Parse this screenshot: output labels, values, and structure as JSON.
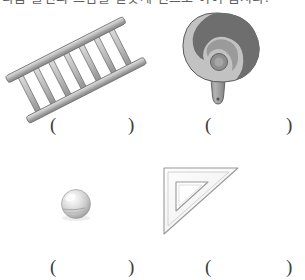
{
  "worksheet": {
    "instruction": "다음 물건의 쓰임을 알맞게 선으로 이어 봅시다.",
    "answer_open": "(",
    "answer_close": ")"
  },
  "colors": {
    "page_background": "#ffffff",
    "ladder_light": "#d8d8d8",
    "ladder_mid": "#b0b0b0",
    "ladder_dark": "#8a8a8a",
    "ladder_outline": "#6f6f6f",
    "fan_light": "#c2c2c2",
    "fan_dark": "#6e6e6e",
    "fan_mid": "#9a9a9a",
    "fan_outline": "#5a5a5a",
    "sphere_light": "#f2f2f2",
    "sphere_mid": "#c9c9c9",
    "sphere_dark": "#9b9b9b",
    "ruler_fill": "#fbfbfb",
    "ruler_outline": "#9a9a9a",
    "paren_color": "#3c3c3c"
  },
  "items": [
    {
      "id": "ladder",
      "icon": "ladder-illustration",
      "label": "사다리",
      "row": 0,
      "column": 0,
      "answer": ""
    },
    {
      "id": "hand-fan",
      "icon": "hand-fan-illustration",
      "label": "부채",
      "row": 0,
      "column": 1,
      "answer": ""
    },
    {
      "id": "ball",
      "icon": "sphere-illustration",
      "label": "공",
      "row": 1,
      "column": 0,
      "answer": ""
    },
    {
      "id": "triangle-ruler",
      "icon": "triangle-ruler-illustration",
      "label": "삼각자",
      "row": 1,
      "column": 1,
      "answer": ""
    }
  ]
}
